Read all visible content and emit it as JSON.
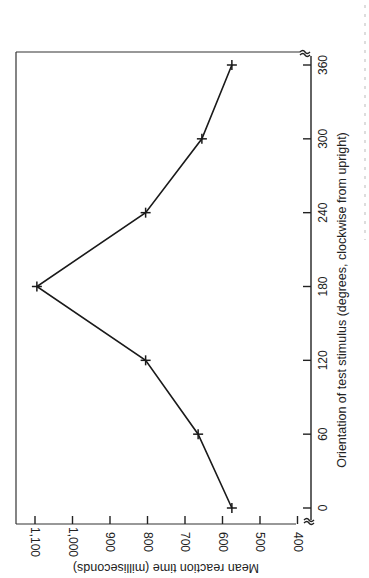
{
  "chart_data": {
    "type": "line",
    "orientation": "rotated 90 degrees (x-axis runs vertically along right side, y-axis along bottom)",
    "title": "",
    "xlabel": "Orientation of test stimulus (degrees, clockwise from upright)",
    "ylabel": "Mean reaction time (milliseconds)",
    "x": [
      0,
      60,
      120,
      180,
      240,
      300,
      360
    ],
    "series": [
      {
        "name": "Mean reaction time",
        "values": [
          575,
          665,
          805,
          1095,
          805,
          655,
          575
        ],
        "marker": "+"
      }
    ],
    "x_ticks": [
      "0",
      "60",
      "120",
      "180",
      "240",
      "300",
      "360"
    ],
    "y_ticks": [
      "400",
      "500",
      "600",
      "700",
      "800",
      "900",
      "1,000",
      "1,100"
    ],
    "xlim": [
      0,
      360
    ],
    "ylim": [
      400,
      1150
    ],
    "axis_breaks": true,
    "grid": false,
    "legend": null
  },
  "labels": {
    "xlabel": "Orientation of test stimulus (degrees, clockwise from upright)",
    "ylabel": "Mean reaction time (milliseconds)",
    "x_ticks": [
      "0",
      "60",
      "120",
      "180",
      "240",
      "300",
      "360"
    ],
    "y_ticks": [
      "1,100",
      "1,000",
      "900",
      "800",
      "700",
      "600",
      "500",
      "400"
    ],
    "caption_fragment": "Fig. ... mean reaction time ... as a function"
  }
}
